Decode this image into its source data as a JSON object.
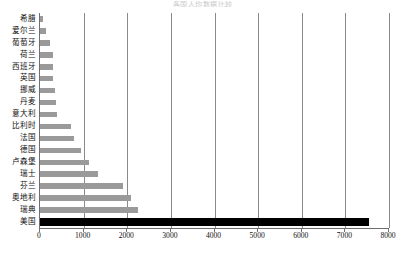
{
  "chart_data": {
    "type": "bar",
    "orientation": "horizontal",
    "title": "各国人均数据比较",
    "xlabel": "",
    "ylabel": "",
    "xlim": [
      0,
      8000
    ],
    "xticks": [
      0,
      1000,
      2000,
      3000,
      4000,
      5000,
      6000,
      7000,
      8000
    ],
    "xtick_labels": [
      "0",
      "1000",
      "2000",
      "3000",
      "4000",
      "5000",
      "6000",
      "7000",
      "8000"
    ],
    "grid": true,
    "legend": false,
    "categories": [
      "希腊",
      "爱尔兰",
      "葡萄牙",
      "荷兰",
      "西班牙",
      "英国",
      "挪威",
      "丹麦",
      "意大利",
      "比利时",
      "法国",
      "德国",
      "卢森堡",
      "瑞士",
      "芬兰",
      "奥地利",
      "瑞典",
      "美国"
    ],
    "values": [
      60,
      130,
      230,
      290,
      290,
      300,
      340,
      360,
      400,
      700,
      780,
      950,
      1120,
      1330,
      1900,
      2080,
      2250,
      7550
    ],
    "series": [
      {
        "name": "数值",
        "values": [
          60,
          130,
          230,
          290,
          290,
          300,
          340,
          360,
          400,
          700,
          780,
          950,
          1120,
          1330,
          1900,
          2080,
          2250,
          7550
        ]
      }
    ],
    "highlight_category": "美国",
    "colors": {
      "bar": "#9a9a9a",
      "highlight": "#000000",
      "grid": "#8a8a8a",
      "axis": "#6f6f6f"
    }
  }
}
